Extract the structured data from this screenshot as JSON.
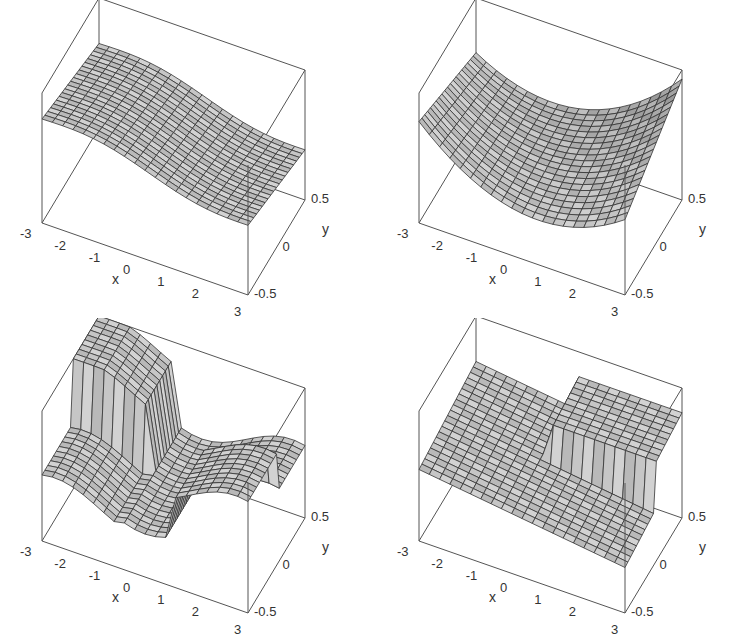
{
  "chart_data": [
    {
      "type": "surface3d",
      "panel": "top-left",
      "title": "",
      "xlabel": "x",
      "ylabel": "y",
      "zlabel": "",
      "x_ticks": [
        "-3",
        "-2",
        "-1",
        "0",
        "1",
        "2",
        "3"
      ],
      "y_ticks": [
        "-0.5",
        "0",
        "0.5"
      ],
      "xlim": [
        -3,
        3
      ],
      "ylim": [
        -0.5,
        0.5
      ],
      "description": "Mostly flat, gently sloping sheet with two small notch discontinuities near the center",
      "grid": "20x20 mesh"
    },
    {
      "type": "surface3d",
      "panel": "top-right",
      "title": "",
      "xlabel": "x",
      "ylabel": "y",
      "zlabel": "",
      "x_ticks": [
        "-3",
        "-2",
        "-1",
        "0",
        "1",
        "2",
        "3"
      ],
      "y_ticks": [
        "-0.5",
        "0",
        "0.5"
      ],
      "xlim": [
        -3,
        3
      ],
      "ylim": [
        -0.5,
        0.5
      ],
      "description": "Smooth saddle/trough surface, curving upward toward the back-right corner",
      "grid": "20x20 mesh"
    },
    {
      "type": "surface3d",
      "panel": "bottom-left",
      "title": "",
      "xlabel": "x",
      "ylabel": "y",
      "zlabel": "",
      "x_ticks": [
        "-3",
        "-2",
        "-1",
        "0",
        "1",
        "2",
        "3"
      ],
      "y_ticks": [
        "-0.5",
        "0",
        "0.5"
      ],
      "xlim": [
        -3,
        3
      ],
      "ylim": [
        -0.5,
        0.5
      ],
      "description": "Cross-shaped surface with two vertical jump discontinuities (walls) left and right",
      "grid": "20x20 mesh"
    },
    {
      "type": "surface3d",
      "panel": "bottom-right",
      "title": "",
      "xlabel": "x",
      "ylabel": "y",
      "zlabel": "",
      "x_ticks": [
        "-3",
        "-2",
        "-1",
        "0",
        "1",
        "2",
        "3"
      ],
      "y_ticks": [
        "-0.5",
        "0",
        "0.5"
      ],
      "xlim": [
        -3,
        3
      ],
      "ylim": [
        -0.5,
        0.5
      ],
      "description": "Sloping sheet with a raised back section and a single vertical jump wall on the right",
      "grid": "20x20 mesh"
    }
  ],
  "axis_labels": {
    "x": "x",
    "y": "y"
  },
  "x_ticks": [
    "-3",
    "-2",
    "-1",
    "0",
    "1",
    "2",
    "3"
  ],
  "y_ticks": [
    "-0.5",
    "0",
    "0.5"
  ],
  "colors": {
    "surface": "#c8c8c8",
    "mesh": "#333333",
    "box": "#555555"
  }
}
